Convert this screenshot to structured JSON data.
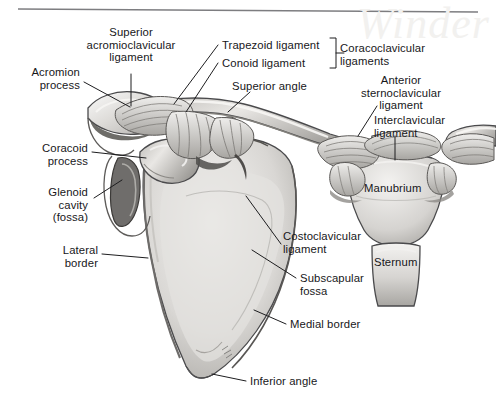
{
  "figure": {
    "background_color": "#ffffff",
    "bone_fill_light": "#eeecea",
    "bone_fill_mid": "#cfcdca",
    "bone_fill_dark": "#9a9894",
    "outline_color": "#4a4a4c",
    "leader_color": "#1d1d1f",
    "label_color": "#17171a",
    "rule_color": "#7d7d80",
    "watermark_text": "Winder"
  },
  "labels": [
    {
      "id": "superior-acromioclavicular-ligament",
      "text": "Superior\nacromioclavicular\nligament",
      "x": 72,
      "y": 26,
      "align": "center",
      "width": 118
    },
    {
      "id": "acromion-process",
      "text": "Acromion\nprocess",
      "x": 8,
      "y": 66,
      "align": "right",
      "width": 72
    },
    {
      "id": "coracoid-process",
      "text": "Coracoid\nprocess",
      "x": 16,
      "y": 142,
      "align": "right",
      "width": 72
    },
    {
      "id": "glenoid-cavity-fossa",
      "text": "Glenoid\ncavity\n(fossa)",
      "x": 24,
      "y": 186,
      "align": "right",
      "width": 64
    },
    {
      "id": "lateral-border",
      "text": "Lateral\nborder",
      "x": 40,
      "y": 244,
      "align": "right",
      "width": 58
    },
    {
      "id": "trapezoid-ligament",
      "text": "Trapezoid ligament",
      "x": 222,
      "y": 39,
      "align": "left",
      "width": 104
    },
    {
      "id": "conoid-ligament",
      "text": "Conoid ligament",
      "x": 222,
      "y": 57,
      "align": "left",
      "width": 104
    },
    {
      "id": "coracoclavicular-ligaments",
      "text": "Coracoclavicular\nligaments",
      "x": 340,
      "y": 42,
      "align": "left",
      "width": 100
    },
    {
      "id": "superior-angle",
      "text": "Superior angle",
      "x": 232,
      "y": 80,
      "align": "left",
      "width": 86
    },
    {
      "id": "anterior-sternoclavicular-ligament",
      "text": "Anterior\nsternoclavicular\nligament",
      "x": 352,
      "y": 74,
      "align": "center",
      "width": 96
    },
    {
      "id": "interclavicular-ligament",
      "text": "Interclavicular\nligament",
      "x": 374,
      "y": 114,
      "align": "left",
      "width": 86
    },
    {
      "id": "manubrium",
      "text": "Manubrium",
      "x": 364,
      "y": 182,
      "align": "left",
      "width": 70
    },
    {
      "id": "sternum",
      "text": "Sternum",
      "x": 374,
      "y": 256,
      "align": "left",
      "width": 56
    },
    {
      "id": "costoclavicular-ligament",
      "text": "Costoclavicular\nligament",
      "x": 283,
      "y": 230,
      "align": "left",
      "width": 92
    },
    {
      "id": "subscapular-fossa",
      "text": "Subscapular\nfossa",
      "x": 300,
      "y": 272,
      "align": "left",
      "width": 78
    },
    {
      "id": "medial-border",
      "text": "Medial border",
      "x": 290,
      "y": 318,
      "align": "left",
      "width": 84
    },
    {
      "id": "inferior-angle",
      "text": "Inferior angle",
      "x": 250,
      "y": 375,
      "align": "left",
      "width": 82
    }
  ],
  "leader_lines": [
    {
      "id": "leader-superior-acromioclavicular-ligament",
      "points": "131,74 131,106"
    },
    {
      "id": "leader-acromion-process",
      "points": "84,82 130,107"
    },
    {
      "id": "leader-coracoid-process",
      "points": "92,152 146,158"
    },
    {
      "id": "leader-glenoid-cavity",
      "points": "94,198 122,180"
    },
    {
      "id": "leader-lateral-border",
      "points": "102,254 148,258"
    },
    {
      "id": "leader-trapezoid-ligament",
      "points": "218,45 174,104"
    },
    {
      "id": "leader-conoid-ligament",
      "points": "218,63 186,112"
    },
    {
      "id": "leader-superior-angle",
      "points": "250,92 228,112"
    },
    {
      "id": "leader-anterior-sternoclavicular-ligament",
      "points": "377,106 358,136"
    },
    {
      "id": "leader-interclavicular-ligament",
      "points": "395,136 395,160"
    },
    {
      "id": "leader-costoclavicular-ligament",
      "points": "281,244 246,196"
    },
    {
      "id": "leader-subscapular-fossa",
      "points": "296,278 252,250"
    },
    {
      "id": "leader-medial-border",
      "points": "286,324 254,310"
    },
    {
      "id": "leader-inferior-angle",
      "points": "246,381 212,374"
    },
    {
      "id": "bracket-coracoclavicular",
      "points": "330,38 336,38 336,68 330,68"
    },
    {
      "id": "bracket-coracoclavicular-stem",
      "points": "336,53 344,53"
    }
  ],
  "artist_signature": {
    "id": "artist-signature",
    "text": "",
    "x": 222,
    "y": 352
  },
  "top_rule": {
    "id": "top-rule",
    "x1": 18,
    "y1": 9,
    "x2": 478,
    "y2": 12
  }
}
